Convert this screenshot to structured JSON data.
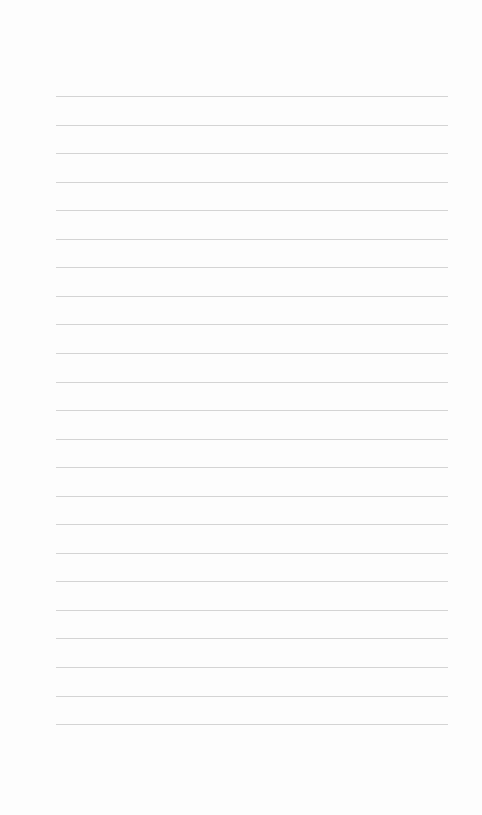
{
  "page": {
    "type": "lined-paper",
    "line_count": 23,
    "first_line_y": 96,
    "line_spacing": 28.55,
    "line_left": 56,
    "line_width": 392,
    "line_color": "#d4d4d4",
    "background_color": "#fdfdfd"
  }
}
